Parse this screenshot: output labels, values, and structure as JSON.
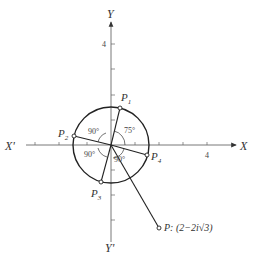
{
  "axes": {
    "x_pos_label": "X",
    "x_neg_label": "X'",
    "y_pos_label": "Y",
    "y_neg_label": "Y'",
    "x_tick_label": "4",
    "y_tick_label": "4"
  },
  "points": {
    "p1": "P",
    "p1_sub": "1",
    "p2": "P",
    "p2_sub": "2",
    "p3": "P",
    "p3_sub": "3",
    "p4": "P",
    "p4_sub": "4",
    "p": "P: (2−2i√3)"
  },
  "angles": {
    "a1": "75°",
    "a2": "90°",
    "a3": "90°",
    "a4": "90°"
  }
}
